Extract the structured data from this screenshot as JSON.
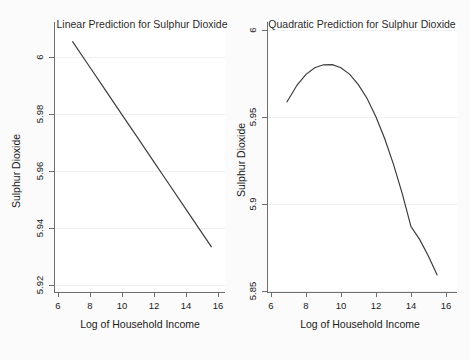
{
  "figure": {
    "background_color": "#fbfbfb",
    "panel_count": 2
  },
  "chart_data": [
    {
      "type": "line",
      "panel": "left",
      "title": "Linear Prediction for Sulphur Dioxide",
      "xlabel": "Log of Household Income",
      "ylabel": "Sulphur Dioxide",
      "xlim": [
        6,
        16
      ],
      "ylim": [
        5.92,
        6.005
      ],
      "xticks": [
        6,
        8,
        10,
        12,
        14,
        16
      ],
      "xtick_labels": [
        "6",
        "8",
        "10",
        "12",
        "14",
        "16"
      ],
      "yticks": [
        5.92,
        5.94,
        5.96,
        5.98,
        6
      ],
      "ytick_labels": [
        "5.92",
        "5.94",
        "5.96",
        "5.98",
        "6"
      ],
      "grid": "horizontal",
      "legend": "none",
      "x": [
        6.9,
        7.9,
        8.9,
        9.9,
        10.9,
        11.9,
        12.9,
        13.9,
        14.9,
        15.6
      ],
      "y": [
        6.0055,
        5.9972,
        5.9889,
        5.9806,
        5.9723,
        5.964,
        5.9557,
        5.9474,
        5.9391,
        5.9333
      ],
      "line_color": "#3d3d3d"
    },
    {
      "type": "line",
      "panel": "right",
      "title": "Quadratic Prediction for Sulphur Dioxide",
      "xlabel": "Log of Household Income",
      "ylabel": "Sulphur Dioxide",
      "xlim": [
        6,
        16
      ],
      "ylim": [
        5.85,
        6.0
      ],
      "xticks": [
        6,
        8,
        10,
        12,
        14,
        16
      ],
      "xtick_labels": [
        "6",
        "8",
        "10",
        "12",
        "14",
        "16"
      ],
      "yticks": [
        5.85,
        5.9,
        5.95,
        6
      ],
      "ytick_labels": [
        "5.85",
        "5.9",
        "5.95",
        "6"
      ],
      "grid": "horizontal",
      "legend": "none",
      "x": [
        6.9,
        7.5,
        8.0,
        8.5,
        9.0,
        9.5,
        10.0,
        10.5,
        11.0,
        11.5,
        12.0,
        12.5,
        13.0,
        13.5,
        14.0,
        14.5,
        15.0,
        15.5
      ],
      "y": [
        5.9585,
        5.9685,
        5.9745,
        5.9783,
        5.98,
        5.9801,
        5.9783,
        5.9745,
        5.9685,
        5.9605,
        5.95,
        5.9375,
        5.9228,
        5.906,
        5.887,
        5.8795,
        5.87,
        5.859
      ],
      "line_color": "#3d3d3d"
    }
  ]
}
